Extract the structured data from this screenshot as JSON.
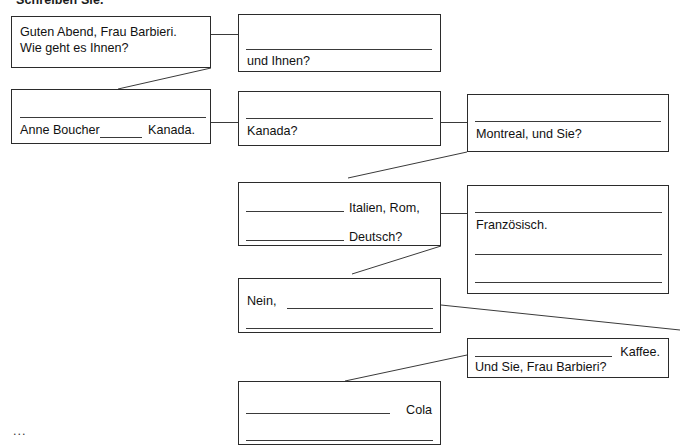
{
  "page": {
    "instruction": "Schreiben Sie.",
    "trailing_ellipsis": "...",
    "ink_color": "#2b2b2b",
    "background_color": "#ffffff"
  },
  "boxes": [
    {
      "id": "box-greeting",
      "name": "speech-box-greeting",
      "lines": [
        "Guten Abend, Frau Barbieri.",
        "Wie geht es Ihnen?"
      ],
      "blanks": 0
    },
    {
      "id": "box-und-ihnen",
      "name": "speech-box-und-ihnen",
      "lines": [
        "und Ihnen?"
      ],
      "blanks": 1
    },
    {
      "id": "box-anne-boucher",
      "name": "speech-box-anne-boucher",
      "lines": [
        "Anne Boucher ______ Kanada."
      ],
      "text_before": "Anne Boucher",
      "text_after": "Kanada.",
      "blanks": 1
    },
    {
      "id": "box-kanada",
      "name": "speech-box-kanada",
      "lines": [
        "Kanada?"
      ],
      "blanks": 1
    },
    {
      "id": "box-montreal",
      "name": "speech-box-montreal",
      "lines": [
        "Montreal, und Sie?"
      ],
      "blanks": 1
    },
    {
      "id": "box-italien-rom",
      "name": "speech-box-italien-rom-deutsch",
      "lines": [
        "Italien, Rom,",
        "Deutsch?"
      ],
      "blanks": 2
    },
    {
      "id": "box-franzoesisch",
      "name": "speech-box-franzoesisch",
      "lines": [
        "Französisch."
      ],
      "blanks": 3
    },
    {
      "id": "box-nein",
      "name": "speech-box-nein",
      "lines": [
        "Nein,"
      ],
      "blanks": 2
    },
    {
      "id": "box-kaffee",
      "name": "speech-box-kaffee",
      "lines": [
        "Kaffee.",
        "Und Sie, Frau Barbieri?"
      ],
      "blanks": 1
    },
    {
      "id": "box-cola",
      "name": "speech-box-cola",
      "lines": [
        "Cola"
      ],
      "blanks": 2
    }
  ],
  "labels": {
    "greeting_line1": "Guten Abend, Frau Barbieri.",
    "greeting_line2": "Wie geht es Ihnen?",
    "und_ihnen": "und Ihnen?",
    "anne_before": "Anne Boucher",
    "anne_blank": "______",
    "anne_after": "Kanada.",
    "kanada": "Kanada?",
    "montreal": "Montreal, und Sie?",
    "italien_rom": "Italien, Rom,",
    "deutsch": "Deutsch?",
    "franzoesisch": "Französisch.",
    "nein": "Nein,",
    "kaffee": "Kaffee.",
    "und_sie_frau_barbieri": "Und Sie, Frau Barbieri?",
    "cola": "Cola"
  }
}
